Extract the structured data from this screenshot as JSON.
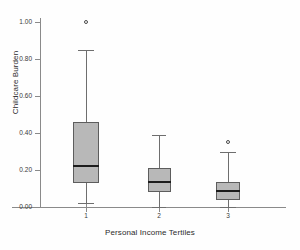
{
  "chart_data": {
    "type": "box",
    "title": "",
    "xlabel": "Personal Income Tertiles",
    "ylabel": "Childcare Burden",
    "ylim": [
      0.0,
      1.05
    ],
    "ytick_labels": [
      "0.00",
      "0.20",
      "0.40",
      "0.60",
      "0.80",
      "1.00"
    ],
    "ytick_values": [
      0.0,
      0.2,
      0.4,
      0.6,
      0.8,
      1.0
    ],
    "xtick_labels": [
      "1",
      "2",
      "3"
    ],
    "categories": [
      "1",
      "2",
      "3"
    ],
    "grid": false,
    "legend": "none",
    "boxes": [
      {
        "category": "1",
        "whisker_low": 0.02,
        "q1": 0.13,
        "median": 0.22,
        "q3": 0.46,
        "whisker_high": 0.85,
        "outliers": [
          1.0
        ]
      },
      {
        "category": "2",
        "whisker_low": 0.0,
        "q1": 0.08,
        "median": 0.135,
        "q3": 0.21,
        "whisker_high": 0.39,
        "outliers": []
      },
      {
        "category": "3",
        "whisker_low": 0.0,
        "q1": 0.04,
        "median": 0.085,
        "q3": 0.135,
        "whisker_high": 0.3,
        "outliers": [
          0.35
        ]
      }
    ],
    "colors": {
      "box_fill": "#b8b8b8",
      "box_edge": "#5d5d5d",
      "median": "#1c1c1c",
      "whisker": "#6e6e6e",
      "axis": "#8a8a8a",
      "text": "#2b2b2b",
      "background": "#fefefe"
    }
  }
}
